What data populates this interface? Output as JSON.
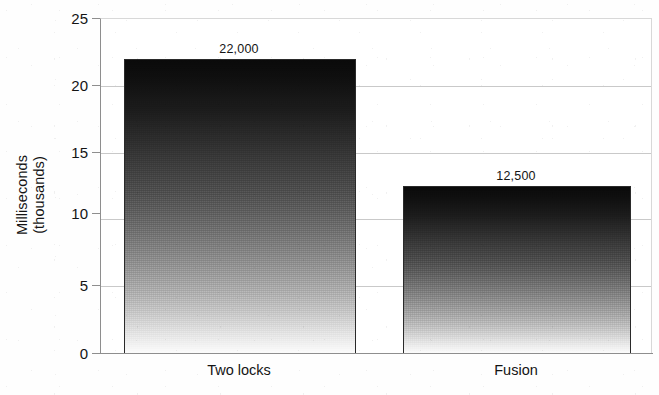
{
  "chart_data": {
    "type": "bar",
    "title": "",
    "xlabel": "",
    "ylabel": "Milliseconds\n(thousands)",
    "ylabel_line1": "Milliseconds",
    "ylabel_line2": "(thousands)",
    "categories": [
      "Two locks",
      "Fusion"
    ],
    "values": [
      22000,
      12500
    ],
    "value_labels": [
      "22,000",
      "12,500"
    ],
    "y_unit_scale": 1000,
    "values_scaled": [
      22,
      12.5
    ],
    "ylim": [
      0,
      25
    ],
    "y_ticks": [
      0,
      5,
      10,
      15,
      20,
      25
    ],
    "y_tick_labels": [
      "0",
      "5",
      "10",
      "15",
      "20",
      "25"
    ],
    "grid": true,
    "grid_axis": "y",
    "legend": false,
    "legend_position": "none",
    "bar_fill": "vertical-gradient-black-to-white",
    "colors": {
      "bar_top": "#0a0a0a",
      "bar_bottom": "#fbfbfb",
      "gridline": "#c9c9c9",
      "axis": "#8e8e8e",
      "text": "#141414",
      "background": "#ffffff"
    }
  }
}
